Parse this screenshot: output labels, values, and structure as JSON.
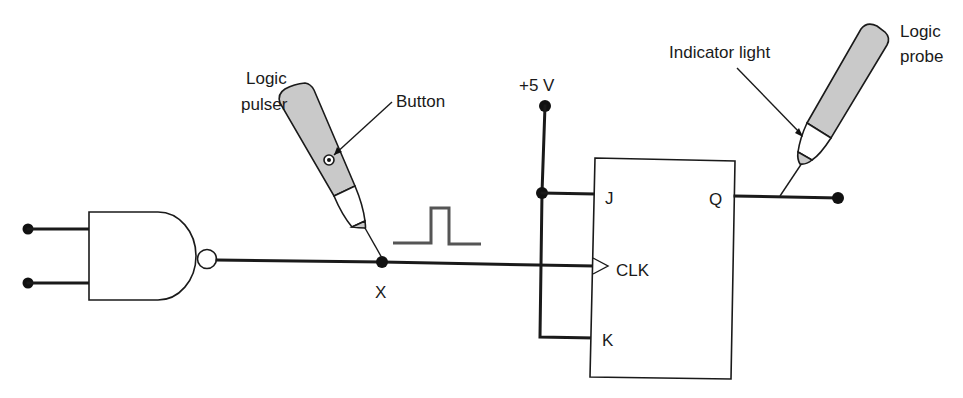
{
  "diagram": {
    "labels": {
      "logic_pulser": [
        "Logic",
        "pulser"
      ],
      "button": "Button",
      "supply": "+5 V",
      "indicator_light": "Indicator light",
      "logic_probe": [
        "Logic",
        "probe"
      ],
      "node_x": "X"
    },
    "flip_flop": {
      "inputs": [
        "J",
        "CLK",
        "K"
      ],
      "output": "Q"
    },
    "gate": {
      "type": "NAND",
      "inputs": 2
    },
    "colors": {
      "line": "#1a1a1a",
      "tool_body": "#c9c9c9",
      "pulse": "#555555",
      "background": "#ffffff"
    }
  }
}
